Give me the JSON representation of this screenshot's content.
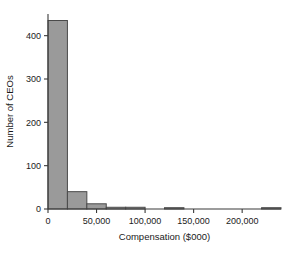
{
  "chart_data": {
    "type": "bar",
    "title": "",
    "subtitle": "",
    "xlabel": "Compensation ($000)",
    "ylabel": "Number of CEOs",
    "grid": false,
    "legend": "none",
    "xlim": [
      0,
      240000
    ],
    "ylim": [
      0,
      450
    ],
    "bin_width": 20000,
    "xticks": [
      0,
      50000,
      100000,
      150000,
      200000
    ],
    "xtick_labels": [
      "0",
      "50,000",
      "100,000",
      "150,000",
      "200,000"
    ],
    "yticks": [
      0,
      100,
      200,
      300,
      400
    ],
    "ytick_labels": [
      "0",
      "100",
      "200",
      "300",
      "400"
    ],
    "bin_starts": [
      0,
      20000,
      40000,
      60000,
      80000,
      100000,
      120000,
      140000,
      160000,
      180000,
      200000,
      220000
    ],
    "values": [
      435,
      40,
      12,
      4,
      4,
      0,
      3,
      0,
      0,
      0,
      0,
      3
    ],
    "bar_fill": "#9a9a9a",
    "bar_stroke": "#4a4a4a",
    "axis_color": "#3a3a3a",
    "text_color": "#1a1a1a",
    "background": "#ffffff"
  },
  "figure": {
    "plot_left": 48,
    "plot_right": 281,
    "plot_top": 14,
    "plot_bottom": 209
  }
}
